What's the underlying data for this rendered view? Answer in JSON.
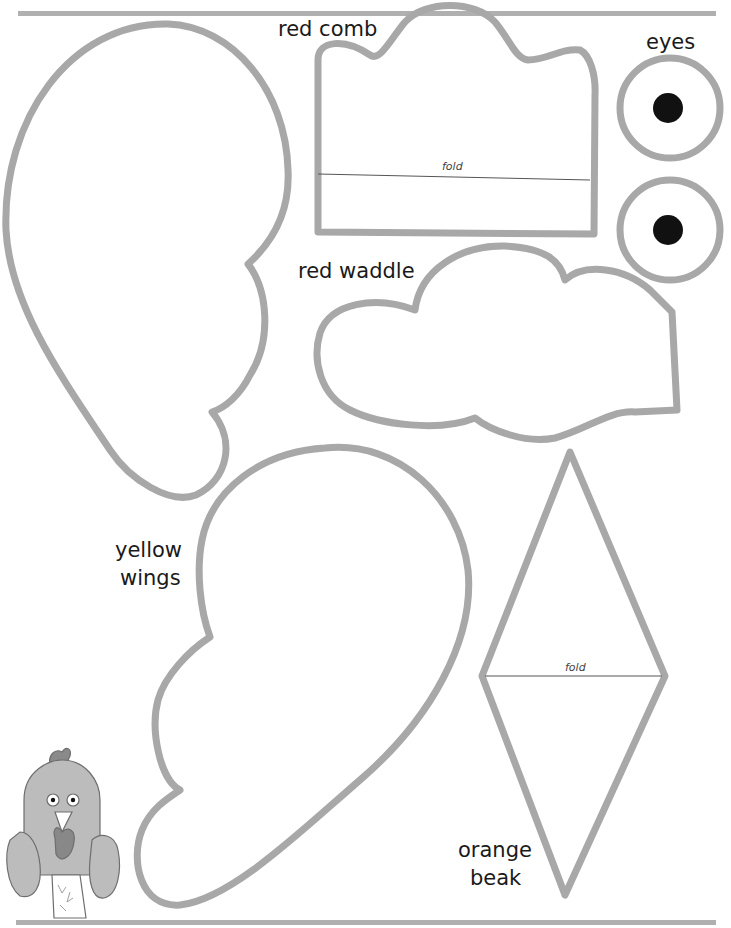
{
  "page": {
    "colors": {
      "outline": "#a8a8a8",
      "text": "#1a1a1a",
      "eye_pupil": "#111111",
      "preview_fill": "#b9b9b9",
      "preview_outline": "#6e6e6e"
    },
    "rules": {
      "top": true,
      "bottom": true
    }
  },
  "pieces": {
    "comb": {
      "label": "red comb",
      "fold_label": "fold"
    },
    "eyes": {
      "label": "eyes",
      "count": 2
    },
    "waddle": {
      "label": "red waddle"
    },
    "wings": {
      "label_line1": "yellow",
      "label_line2": "wings"
    },
    "beak": {
      "label_line1": "orange",
      "label_line2": "beak",
      "fold_label": "fold"
    },
    "body": {
      "label": ""
    }
  },
  "preview": {
    "name": "finished rooster puppet illustration"
  }
}
